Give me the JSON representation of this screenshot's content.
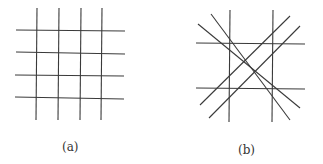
{
  "panels": [
    {
      "label": "(a)",
      "description": "Rectangular grid: 4 vertical and 4 horizontal lines",
      "lines": [
        [
          37,
          8,
          36,
          120
        ],
        [
          59,
          8,
          58,
          120
        ],
        [
          81,
          8,
          80,
          120
        ],
        [
          102,
          8,
          101,
          120
        ],
        [
          16,
          30,
          125,
          31
        ],
        [
          16,
          52,
          125,
          54
        ],
        [
          15,
          75,
          124,
          76
        ],
        [
          15,
          97,
          124,
          99
        ]
      ]
    },
    {
      "label": "(b)",
      "description": "Two vertical, two horizontal and four diagonal lines",
      "lines": [
        [
          230,
          10,
          229,
          122
        ],
        [
          273,
          10,
          272,
          122
        ],
        [
          196,
          43,
          305,
          44
        ],
        [
          196,
          88,
          305,
          89
        ],
        [
          198,
          24,
          300,
          108
        ],
        [
          211,
          14,
          290,
          120
        ],
        [
          290,
          16,
          200,
          105
        ],
        [
          300,
          26,
          209,
          118
        ]
      ]
    }
  ],
  "style": {
    "stroke": "#3a3a3a",
    "stroke_width": 1.1
  }
}
